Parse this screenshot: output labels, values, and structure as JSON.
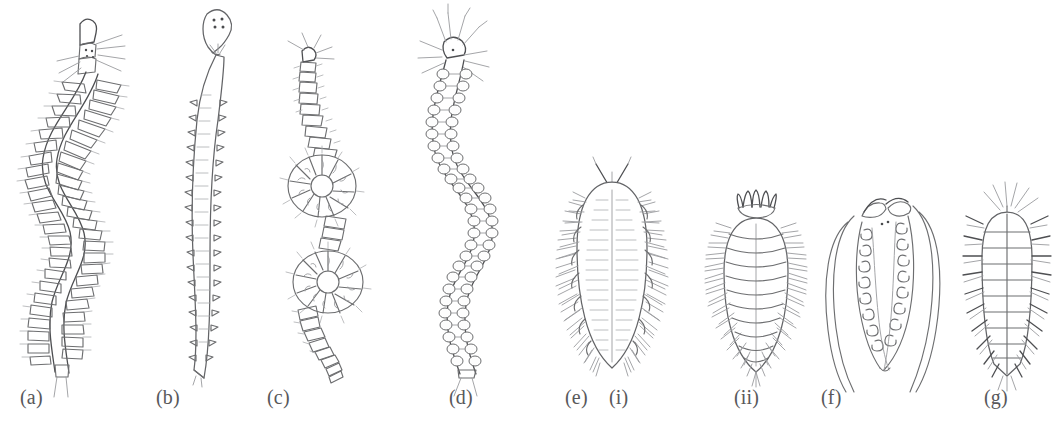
{
  "figure": {
    "background_color": "#ffffff",
    "ink_color": "#6d6e70",
    "ink_dark_color": "#4e4f52",
    "ink_light_color": "#9a9b9e",
    "panels": [
      {
        "id": "a",
        "label": "(a)",
        "x": 20,
        "sub_label": "",
        "sub_x": 0
      },
      {
        "id": "b",
        "label": "(b)",
        "x": 156,
        "sub_label": "",
        "sub_x": 0
      },
      {
        "id": "c",
        "label": "(c)",
        "x": 267,
        "sub_label": "",
        "sub_x": 0
      },
      {
        "id": "d",
        "label": "(d)",
        "x": 449,
        "sub_label": "",
        "sub_x": 0
      },
      {
        "id": "e",
        "label": "(e)",
        "x": 565,
        "sub_label": "(i)",
        "sub_x": 609
      },
      {
        "id": "eii",
        "label": "(ii)",
        "x": 734,
        "sub_label": "",
        "sub_x": 0
      },
      {
        "id": "f",
        "label": "(f)",
        "x": 821,
        "sub_label": "",
        "sub_x": 0
      },
      {
        "id": "g",
        "label": "(g)",
        "x": 984,
        "sub_label": "",
        "sub_x": 0
      }
    ]
  }
}
